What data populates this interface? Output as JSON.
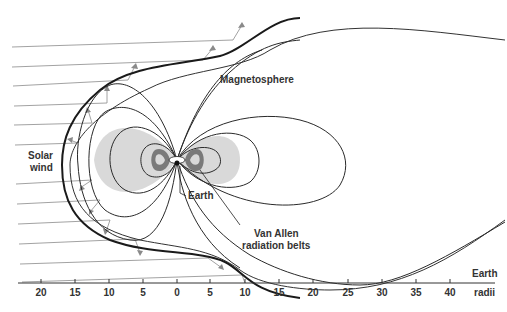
{
  "labels": {
    "magnetosphere": "Magnetosphere",
    "solar_wind_line1": "Solar",
    "solar_wind_line2": "wind",
    "earth": "Earth",
    "van_allen_line1": "Van Allen",
    "van_allen_line2": "radiation belts",
    "axis_unit_line1": "Earth",
    "axis_unit_line2": "radii"
  },
  "axis": {
    "ticks": [
      "20",
      "15",
      "10",
      "5",
      "0",
      "5",
      "10",
      "15",
      "20",
      "25",
      "30",
      "35",
      "40"
    ],
    "unit": "Earth radii"
  },
  "colors": {
    "line": "#2a2a2a",
    "thin_line": "#555555",
    "belt_outer": "#d9d9d9",
    "belt_inner": "#7a7a7a",
    "wind": "#8a8a8a"
  }
}
